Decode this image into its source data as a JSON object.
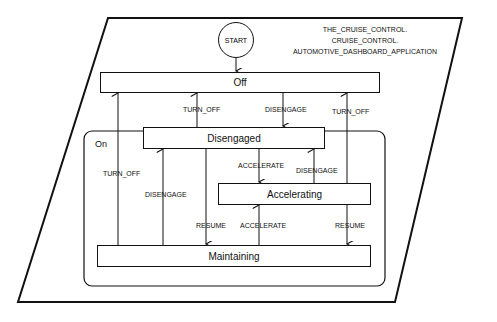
{
  "diagram": {
    "type": "state-machine",
    "title_lines": [
      "THE_CRUISE_CONTROL.",
      "CRUISE_CONTROL.",
      "AUTOMOTIVE_DASHBOARD_APPLICATION"
    ],
    "start_label": "START",
    "composite_state": "On",
    "states": {
      "off": "Off",
      "disengaged": "Disengaged",
      "accelerating": "Accelerating",
      "maintaining": "Maintaining"
    },
    "transitions": [
      {
        "from": "START",
        "to": "Off",
        "label": ""
      },
      {
        "from": "Maintaining",
        "to": "Off",
        "label": "TURN_OFF"
      },
      {
        "from": "Disengaged",
        "to": "Off",
        "label": "TURN_OFF"
      },
      {
        "from": "Off",
        "to": "Disengaged",
        "label": "DISENGAGE"
      },
      {
        "from": "Accelerating",
        "to": "Off",
        "label": "TURN_OFF"
      },
      {
        "from": "Maintaining",
        "to": "Disengaged",
        "label": "DISENGAGE"
      },
      {
        "from": "Disengaged",
        "to": "Accelerating",
        "label": "ACCELERATE"
      },
      {
        "from": "Accelerating",
        "to": "Disengaged",
        "label": "DISENGAGE"
      },
      {
        "from": "Disengaged",
        "to": "Maintaining",
        "label": "RESUME"
      },
      {
        "from": "Maintaining",
        "to": "Accelerating",
        "label": "ACCELERATE"
      },
      {
        "from": "Accelerating",
        "to": "Maintaining",
        "label": "RESUME"
      }
    ]
  }
}
